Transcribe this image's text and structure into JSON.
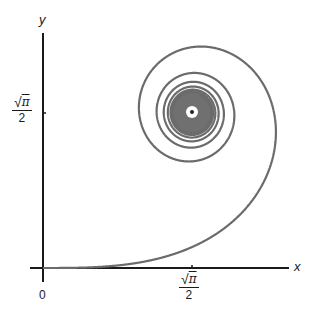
{
  "figure": {
    "x_axis": {
      "label": "x",
      "origin_label": "0",
      "tick_label": {
        "radical": "√",
        "radicand": "π",
        "denominator": "2"
      }
    },
    "y_axis": {
      "label": "y",
      "tick_label": {
        "radical": "√",
        "radicand": "π",
        "denominator": "2"
      }
    },
    "colors": {
      "axis": "#1a1a1a",
      "curve": "#6b6b6b",
      "core": "#707070"
    }
  },
  "chart_data": {
    "type": "line",
    "title": "",
    "xlabel": "x",
    "ylabel": "y",
    "x_ticks": [
      {
        "value": 0,
        "label": "0"
      },
      {
        "value": 0.8862,
        "label": "√π/2"
      }
    ],
    "y_ticks": [
      {
        "value": 0.8862,
        "label": "√π/2"
      }
    ],
    "limit_point": [
      0.8862,
      0.8862
    ],
    "s_range": [
      0,
      9
    ],
    "grid": false,
    "legend": null
  }
}
